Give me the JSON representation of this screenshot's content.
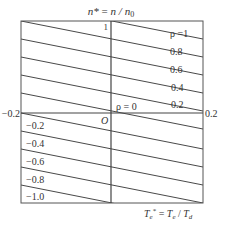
{
  "title": "n* = n / n0",
  "title_parts": {
    "lhs": "n*",
    "eq": " = ",
    "rhs": "n / n",
    "sub": "0"
  },
  "x_axis_label": {
    "lhs": "T",
    "lhs_sub": "e",
    "sup": "*",
    "eq": " = ",
    "rhs1": "T",
    "rhs1_sub": "e",
    "slash": " / ",
    "rhs2": "T",
    "rhs2_sub": "d"
  },
  "x_ticks": {
    "left": "−0.2",
    "right": "0.2"
  },
  "y_top_tick": "1",
  "origin_label": "O",
  "rho_labels_upper": [
    "ρ =1",
    "0.8",
    "0.6",
    "0.4",
    "0.2"
  ],
  "rho_zero_label": "ρ = 0",
  "rho_labels_lower": [
    "−0.2",
    "−0.4",
    "−0.6",
    "−0.8",
    "−1.0"
  ],
  "colors": {
    "line": "#333333",
    "frame": "#555555",
    "text": "#333333"
  }
}
